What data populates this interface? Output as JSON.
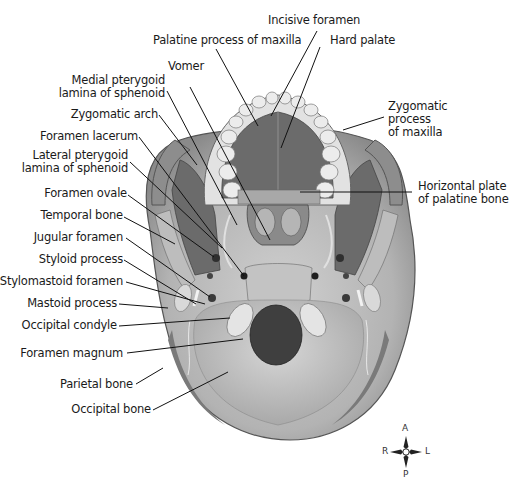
{
  "figure": {
    "colors": {
      "bone_light": "#c9c9c9",
      "bone_mid": "#9e9e9e",
      "bone_dark": "#5e5e5e",
      "palate": "#6b6b6b",
      "foramen_magnum": "#3f3f3f",
      "teeth": "#e6e6e6",
      "leader_line": "#111111"
    }
  },
  "labels": {
    "top": [
      {
        "id": "incisive-foramen",
        "text": "Incisive foramen"
      },
      {
        "id": "palatine-process-of-maxilla",
        "text": "Palatine process of maxilla"
      },
      {
        "id": "hard-palate",
        "text": "Hard palate"
      },
      {
        "id": "vomer",
        "text": "Vomer"
      }
    ],
    "left": [
      {
        "id": "medial-pterygoid-lamina",
        "lines": [
          "Medial pterygoid",
          "lamina of sphenoid"
        ]
      },
      {
        "id": "zygomatic-arch",
        "text": "Zygomatic arch"
      },
      {
        "id": "foramen-lacerum",
        "text": "Foramen lacerum"
      },
      {
        "id": "lateral-pterygoid-lamina",
        "lines": [
          "Lateral pterygoid",
          "lamina of sphenoid"
        ]
      },
      {
        "id": "foramen-ovale",
        "text": "Foramen ovale"
      },
      {
        "id": "temporal-bone",
        "text": "Temporal bone"
      },
      {
        "id": "jugular-foramen",
        "text": "Jugular foramen"
      },
      {
        "id": "styloid-process",
        "text": "Styloid process"
      },
      {
        "id": "stylomastoid-foramen",
        "text": "Stylomastoid foramen"
      },
      {
        "id": "mastoid-process",
        "text": "Mastoid process"
      },
      {
        "id": "occipital-condyle",
        "text": "Occipital condyle"
      },
      {
        "id": "foramen-magnum",
        "text": "Foramen magnum"
      },
      {
        "id": "parietal-bone",
        "text": "Parietal bone"
      },
      {
        "id": "occipital-bone",
        "text": "Occipital bone"
      }
    ],
    "right": [
      {
        "id": "zygomatic-process-of-maxilla",
        "lines": [
          "Zygomatic",
          "process",
          "of maxilla"
        ]
      },
      {
        "id": "horizontal-plate",
        "lines": [
          "Horizontal plate",
          "of palatine bone"
        ]
      }
    ]
  },
  "compass": {
    "top": "A",
    "bottom": "P",
    "left": "R",
    "right": "L"
  }
}
